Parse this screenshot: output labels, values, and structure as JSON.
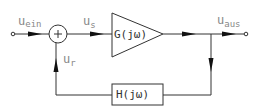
{
  "diagram": {
    "type": "feedback-control-loop",
    "signals": {
      "input": {
        "main": "u",
        "sub": "ein"
      },
      "error": {
        "main": "u",
        "sub": "s"
      },
      "output": {
        "main": "u",
        "sub": "aus"
      },
      "feedback": {
        "main": "u",
        "sub": "r"
      }
    },
    "blocks": {
      "forward": "G(jω)",
      "feedback": "H(jω)"
    },
    "summing_junction": {
      "symbol": "+"
    },
    "colors": {
      "line": "#333333",
      "label": "#888888",
      "background": "#ffffff"
    }
  }
}
